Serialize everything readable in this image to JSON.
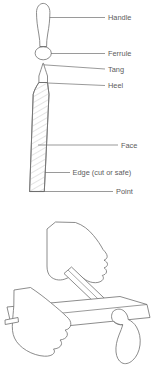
{
  "figure": {
    "stroke_color": "#6e6e6e",
    "hatch_color": "#bdbdbd",
    "label_color": "#5c5c5c",
    "background": "#ffffff",
    "width": 161,
    "height": 373
  },
  "labels": [
    {
      "id": "handle",
      "text": "Handle"
    },
    {
      "id": "ferrule",
      "text": "Ferrule"
    },
    {
      "id": "tang",
      "text": "Tang"
    },
    {
      "id": "heel",
      "text": "Heel"
    },
    {
      "id": "face",
      "text": "Face"
    },
    {
      "id": "edge",
      "text": "Edge (cut or safe)"
    },
    {
      "id": "point",
      "text": "Point"
    }
  ],
  "parts": {
    "handle": "handle-shape",
    "ferrule": "ferrule-shape",
    "tang": "tang-shape",
    "blade": "file-blade-shape",
    "hatching": "blade-hatching"
  },
  "illustration": {
    "name": "two-hands-filing-workpiece",
    "elements": [
      "upper-hand",
      "lower-fist",
      "workpiece-bar",
      "file-blade",
      "file-handle"
    ]
  }
}
